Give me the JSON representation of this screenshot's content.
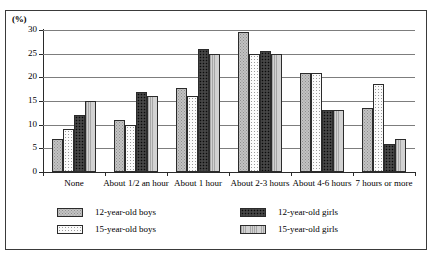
{
  "chart_data": {
    "type": "bar",
    "title": "",
    "subtitle": "",
    "unit_label": "(%)",
    "xlabel": "",
    "ylabel": "",
    "ylim": [
      0,
      30
    ],
    "yticks": [
      0,
      5,
      10,
      15,
      20,
      25,
      30
    ],
    "ytick_labels": [
      "0",
      "5",
      "10",
      "15",
      "20",
      "25",
      "30"
    ],
    "grid": true,
    "legend_position": "bottom",
    "categories": [
      "None",
      "About 1/2 an hour",
      "About 1 hour",
      "About 2-3 hours",
      "About 4-6 hours",
      "7 hours or more"
    ],
    "series": [
      {
        "name": "12-year-old boys",
        "pattern": "light-grey-speckle",
        "color": "#c3c3c3",
        "values": [
          7,
          11,
          17.7,
          29.5,
          21,
          13.5
        ]
      },
      {
        "name": "15-year-old boys",
        "pattern": "white-fine-dots",
        "color": "#fbfbfb",
        "values": [
          9,
          10,
          16,
          25,
          21,
          18.5
        ]
      },
      {
        "name": "12-year-old girls",
        "pattern": "dark-speckle",
        "color": "#3a3a3a",
        "values": [
          12,
          17,
          26,
          25.5,
          13,
          6
        ]
      },
      {
        "name": "15-year-old girls",
        "pattern": "grey-vertical-lines",
        "color": "#bdbdbd",
        "values": [
          15,
          16,
          25,
          25,
          13,
          7
        ]
      }
    ]
  },
  "legend": {
    "entries": [
      "12-year-old boys",
      "12-year-old girls",
      "15-year-old boys",
      "15-year-old girls"
    ]
  }
}
